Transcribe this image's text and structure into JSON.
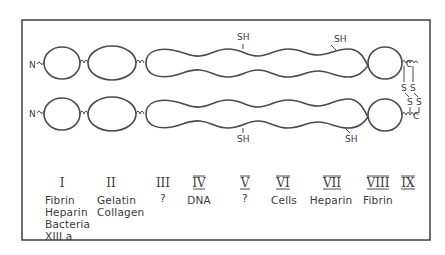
{
  "figure": {
    "chains": [
      {
        "n_label": "N",
        "c_label": "C",
        "sh_labels": [
          "SH",
          "SH"
        ]
      },
      {
        "n_label": "N",
        "c_label": "C",
        "sh_labels": [
          "SH",
          "SH"
        ]
      }
    ],
    "disulfide_labels": [
      "S",
      "S",
      "S",
      "S"
    ],
    "domains": [
      {
        "numeral": "I",
        "binds": [
          "Fibrin",
          "Heparin",
          "Bacteria",
          "XIII a"
        ]
      },
      {
        "numeral": "II",
        "binds": [
          "Gelatin",
          "Collagen"
        ]
      },
      {
        "numeral": "III",
        "binds": [
          "?"
        ]
      },
      {
        "numeral": "IV",
        "binds": [
          "DNA"
        ]
      },
      {
        "numeral": "V",
        "binds": [
          "?"
        ]
      },
      {
        "numeral": "VI",
        "binds": [
          "Cells"
        ]
      },
      {
        "numeral": "VII",
        "binds": [
          "Heparin"
        ]
      },
      {
        "numeral": "VIII",
        "binds": [
          "Fibrin"
        ]
      },
      {
        "numeral": "IX",
        "binds": []
      }
    ],
    "colors": {
      "line": "#4a4a4a",
      "frame": "#4a4a4a",
      "background": "#ffffff"
    }
  }
}
